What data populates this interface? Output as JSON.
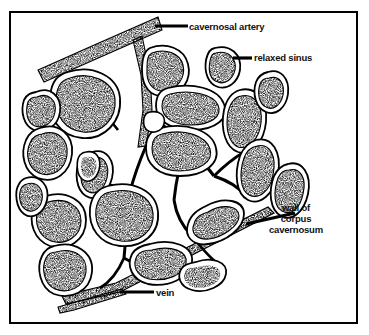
{
  "figure": {
    "background_color": "#ffffff",
    "ink_color": "#000000",
    "frame": {
      "name": "diagram-border",
      "style": "thin black rectangle"
    }
  },
  "labels": [
    {
      "id": "cavernosal-artery",
      "text": "cavernosal artery",
      "lines": [
        "cavernosal artery"
      ],
      "x": 188,
      "y": 22,
      "align": "left",
      "leader": {
        "x1": 155,
        "y1": 26,
        "x2": 188,
        "y2": 26,
        "width": 3
      }
    },
    {
      "id": "relaxed-sinus",
      "text": "relaxed sinus",
      "lines": [
        "relaxed sinus"
      ],
      "x": 253,
      "y": 53,
      "align": "left",
      "leader": {
        "x1": 233,
        "y1": 58,
        "x2": 252,
        "y2": 58,
        "width": 3
      }
    },
    {
      "id": "wall-of-corpus-cavernosum",
      "text": "wall of corpus cavernosum",
      "lines": [
        "wall of",
        "corpus",
        "cavernosum"
      ],
      "x": 296,
      "y": 207,
      "align": "center",
      "leader": {
        "x1": 246,
        "y1": 224,
        "x2": 296,
        "y2": 213,
        "width": 3
      }
    },
    {
      "id": "vein",
      "text": "vein",
      "lines": [
        "vein"
      ],
      "x": 155,
      "y": 288,
      "align": "left",
      "leader": {
        "x1": 120,
        "y1": 292,
        "x2": 154,
        "y2": 292,
        "width": 3
      }
    }
  ],
  "structures": {
    "cavernosal_artery": {
      "name": "cavernosal-artery-band",
      "description": "thick stippled diagonal band, upper left to upper right"
    },
    "wall": {
      "name": "corpus-cavernosum-wall-band",
      "description": "thick stippled diagonal band, lower left to right"
    },
    "vein": {
      "name": "vein-band",
      "description": "thin stippled band at lower left along the wall"
    },
    "sinus_count": 22,
    "sinus_description": "irregular rounded lacunar spaces, black outline with stippled interior"
  }
}
